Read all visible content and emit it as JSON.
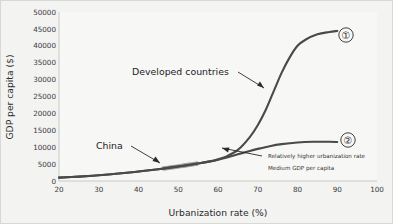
{
  "chart_data": {
    "type": "line",
    "title": "",
    "xlabel": "Urbanization rate (%)",
    "ylabel": "GDP per capita ($)",
    "xlim": [
      20,
      100
    ],
    "ylim": [
      0,
      50000
    ],
    "xticks": [
      "20",
      "30",
      "40",
      "50",
      "60",
      "70",
      "80",
      "90",
      "100"
    ],
    "yticks": [
      "0",
      "5000",
      "10000",
      "15000",
      "20000",
      "25000",
      "30000",
      "35000",
      "40000",
      "45000",
      "50000"
    ],
    "grid": false,
    "legend": "none",
    "series": [
      {
        "name": "Developed countries",
        "marker_label": "①",
        "x": [
          20,
          25,
          30,
          35,
          40,
          45,
          50,
          55,
          58,
          60,
          62,
          65,
          68,
          70,
          72,
          74,
          76,
          78,
          80,
          82,
          85,
          88,
          90
        ],
        "y": [
          1000,
          1300,
          1700,
          2200,
          2800,
          3500,
          4300,
          5200,
          5800,
          6400,
          7200,
          9200,
          13000,
          16500,
          21000,
          26500,
          32000,
          36500,
          40000,
          41800,
          43400,
          44100,
          44400
        ]
      },
      {
        "name": "Relatively higher urbanization rate / Medium GDP per capita",
        "marker_label": "②",
        "x": [
          20,
          25,
          30,
          35,
          40,
          45,
          50,
          55,
          58,
          60,
          62,
          65,
          68,
          70,
          73,
          76,
          80,
          84,
          88,
          90
        ],
        "y": [
          1000,
          1300,
          1700,
          2200,
          2800,
          3500,
          4300,
          5200,
          5800,
          6300,
          6900,
          7900,
          8900,
          9500,
          10300,
          10900,
          11400,
          11600,
          11600,
          11550
        ]
      }
    ],
    "highlight": {
      "name": "China",
      "x_start": 46,
      "x_end": 55,
      "color": "#8e8e8e"
    }
  },
  "annotations": {
    "developed": "Developed countries",
    "china": "China",
    "note_line1": "Relatively higher urbanization rate",
    "note_line2": "Medium GDP per capita",
    "marker1": "①",
    "marker2": "②"
  },
  "colors": {
    "curve": "#4a4a4a",
    "highlight": "#8e8e8e",
    "axis": "#c9c9c7",
    "text": "#222222",
    "background": "#f3f3f2",
    "plot_background": "#f7f7f6"
  }
}
